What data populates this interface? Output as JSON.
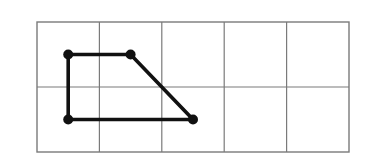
{
  "diagram": {
    "type": "grid_polygon",
    "grid": {
      "columns": 5,
      "rows": 2,
      "origin_px": [
        37,
        22
      ],
      "cell_width_px": 62.4,
      "cell_height_px": 65,
      "line_color": "#7a7a7a"
    },
    "shape": {
      "name": "trapezoid",
      "stroke_color": "#111111",
      "vertices_cell_coords": [
        {
          "label": "top-left",
          "col": 0.5,
          "row": 0.5
        },
        {
          "label": "top-right",
          "col": 1.5,
          "row": 0.5
        },
        {
          "label": "bottom-right",
          "col": 2.5,
          "row": 1.5
        },
        {
          "label": "bottom-left",
          "col": 0.5,
          "row": 1.5
        }
      ]
    }
  }
}
